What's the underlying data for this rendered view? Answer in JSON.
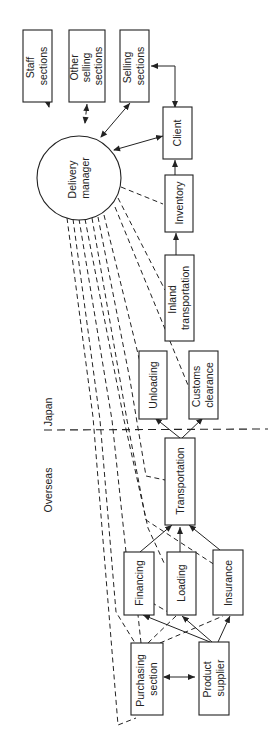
{
  "diagram": {
    "title": "",
    "regions": {
      "japan": "Japan",
      "overseas": "Overseas"
    },
    "nodes": {
      "staff_sections": [
        "Staff",
        "sections"
      ],
      "other_selling_sections": [
        "Other",
        "selling",
        "sections"
      ],
      "selling_sections": [
        "Selling",
        "sections"
      ],
      "delivery_manager": [
        "Delivery",
        "manager"
      ],
      "client": [
        "Client"
      ],
      "inventory": [
        "Inventory"
      ],
      "inland_transportation": [
        "Inland",
        "transportation"
      ],
      "unloading": [
        "Unloading"
      ],
      "customs_clearance": [
        "Customs",
        "clearance"
      ],
      "transportation": [
        "Transportation"
      ],
      "financing": [
        "Financing"
      ],
      "loading": [
        "Loading"
      ],
      "insurance": [
        "Insurance"
      ],
      "purchasing_section": [
        "Purchasing",
        "section"
      ],
      "product_supplier": [
        "Product",
        "supplier"
      ]
    },
    "edges": [
      {
        "from": "delivery_manager",
        "to": "staff_sections",
        "style": "dashed",
        "arrows": "both"
      },
      {
        "from": "delivery_manager",
        "to": "other_selling_sections",
        "style": "dashed",
        "arrows": "both"
      },
      {
        "from": "delivery_manager",
        "to": "selling_sections",
        "style": "solid",
        "arrows": "both"
      },
      {
        "from": "delivery_manager",
        "to": "client",
        "style": "solid",
        "arrows": "both"
      },
      {
        "from": "client",
        "to": "selling_sections",
        "style": "solid",
        "arrows": "both"
      },
      {
        "from": "inventory",
        "to": "client",
        "style": "solid",
        "arrows": "forward"
      },
      {
        "from": "inland_transportation",
        "to": "inventory",
        "style": "solid",
        "arrows": "forward"
      },
      {
        "from": "transportation",
        "to": "unloading",
        "style": "solid",
        "arrows": "forward"
      },
      {
        "from": "transportation",
        "to": "customs_clearance",
        "style": "solid",
        "arrows": "forward"
      },
      {
        "from": "financing",
        "to": "transportation",
        "style": "solid",
        "arrows": "forward"
      },
      {
        "from": "loading",
        "to": "transportation",
        "style": "solid",
        "arrows": "forward"
      },
      {
        "from": "insurance",
        "to": "transportation",
        "style": "solid",
        "arrows": "forward"
      },
      {
        "from": "product_supplier",
        "to": "financing",
        "style": "solid",
        "arrows": "forward"
      },
      {
        "from": "product_supplier",
        "to": "loading",
        "style": "solid",
        "arrows": "forward"
      },
      {
        "from": "product_supplier",
        "to": "insurance",
        "style": "solid",
        "arrows": "forward"
      },
      {
        "from": "purchasing_section",
        "to": "product_supplier",
        "style": "solid",
        "arrows": "both"
      },
      {
        "from": "purchasing_section",
        "to": "financing",
        "style": "dashed",
        "arrows": "none"
      },
      {
        "from": "purchasing_section",
        "to": "loading",
        "style": "dashed",
        "arrows": "none"
      },
      {
        "from": "purchasing_section",
        "to": "insurance",
        "style": "dashed",
        "arrows": "none"
      },
      {
        "from": "delivery_manager",
        "to": "inventory",
        "style": "dashed",
        "arrows": "none"
      },
      {
        "from": "delivery_manager",
        "to": "inland_transportation",
        "style": "dashed",
        "arrows": "none"
      },
      {
        "from": "delivery_manager",
        "to": "customs_clearance",
        "style": "dashed",
        "arrows": "none"
      },
      {
        "from": "delivery_manager",
        "to": "unloading",
        "style": "dashed",
        "arrows": "none"
      },
      {
        "from": "delivery_manager",
        "to": "transportation",
        "style": "dashed",
        "arrows": "none"
      },
      {
        "from": "delivery_manager",
        "to": "financing",
        "style": "dashed",
        "arrows": "none"
      },
      {
        "from": "delivery_manager",
        "to": "loading",
        "style": "dashed",
        "arrows": "none"
      },
      {
        "from": "delivery_manager",
        "to": "insurance",
        "style": "dashed",
        "arrows": "none"
      },
      {
        "from": "delivery_manager",
        "to": "purchasing_section",
        "style": "dashed",
        "arrows": "none"
      }
    ]
  }
}
